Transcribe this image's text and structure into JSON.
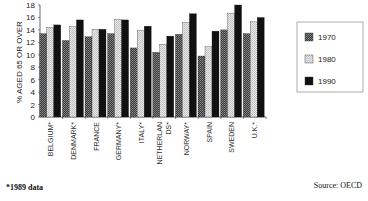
{
  "chart_data": {
    "type": "bar",
    "title": "",
    "xlabel": "",
    "ylabel": "% AGED 65 OR OVER",
    "ylim": [
      0,
      18
    ],
    "yticks": [
      0,
      2,
      4,
      6,
      8,
      10,
      12,
      14,
      16,
      18
    ],
    "grid": false,
    "legend_position": "right",
    "categories": [
      "BELGIUM*",
      "DENMARK*",
      "FRANCE",
      "GERMANY*",
      "ITALY*",
      "NETHERLANDS*",
      "NORWAY*",
      "SPAIN",
      "SWEDEN",
      "U.K.*"
    ],
    "series": [
      {
        "name": "1970",
        "color": "#555555",
        "pattern": "dark-dither",
        "values": [
          13.4,
          12.3,
          12.9,
          13.4,
          11.1,
          10.4,
          13.3,
          9.8,
          14.0,
          13.4
        ]
      },
      {
        "name": "1980",
        "color": "#dcdcdc",
        "pattern": "light-dither",
        "values": [
          14.4,
          14.5,
          14.1,
          15.7,
          13.9,
          11.7,
          15.2,
          11.3,
          16.7,
          15.3
        ]
      },
      {
        "name": "1990",
        "color": "#111111",
        "pattern": "solid",
        "values": [
          14.8,
          15.6,
          14.1,
          15.6,
          14.6,
          13.0,
          16.6,
          13.8,
          18.0,
          16.0
        ]
      }
    ],
    "category_display_labels": [
      "BELGIUM*",
      "DENMARK*",
      "FRANCE",
      "GERMANY*",
      "ITALY*",
      "NETHERLAN DS*",
      "NORWAY*",
      "SPAIN",
      "SWEDEN",
      "U.K.*"
    ]
  },
  "footnote": "*1989 data",
  "source": "Source:  OECD"
}
